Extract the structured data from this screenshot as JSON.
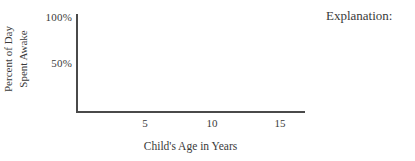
{
  "chart_data": {
    "type": "line",
    "title": "",
    "subtitle": "",
    "xlabel": "Child's Age in Years",
    "ylabel_lines": [
      "Percent of Day",
      "Spent Awake"
    ],
    "ylabel": "Percent of Day Spent Awake",
    "x_ticks": [
      "5",
      "10",
      "15"
    ],
    "x_tick_values": [
      5,
      10,
      15
    ],
    "y_ticks": [
      "100%",
      "50%"
    ],
    "y_tick_values": [
      100,
      50
    ],
    "xlim": [
      0,
      17
    ],
    "ylim": [
      0,
      110
    ],
    "grid": false,
    "legend": "none",
    "series": [],
    "values": [],
    "categories": [],
    "annotations": [],
    "note": "Blank worksheet axes — no data plotted; student is expected to draw the curve."
  },
  "figure": {
    "axis_color": "#4a4a4a",
    "background": "#ffffff",
    "text_color": "#3a3a3a"
  },
  "prompt": {
    "explanation_label": "Explanation:"
  }
}
